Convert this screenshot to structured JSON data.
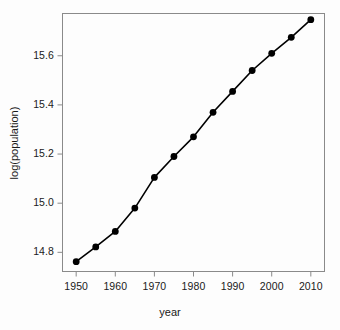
{
  "chart_data": {
    "type": "line",
    "title": "",
    "xlabel": "year",
    "ylabel": "log(population)",
    "x": [
      1950,
      1955,
      1960,
      1965,
      1970,
      1975,
      1980,
      1985,
      1990,
      1995,
      2000,
      2005,
      2010
    ],
    "values": [
      14.762,
      14.822,
      14.885,
      14.98,
      15.105,
      15.19,
      15.27,
      15.37,
      15.455,
      15.54,
      15.61,
      15.675,
      15.747
    ],
    "series": [
      {
        "name": "log(population)",
        "values": [
          14.762,
          14.822,
          14.885,
          14.98,
          15.105,
          15.19,
          15.27,
          15.37,
          15.455,
          15.54,
          15.61,
          15.675,
          15.747
        ]
      }
    ],
    "xlim": [
      1946.5,
      2013.5
    ],
    "ylim": [
      14.722,
      15.772
    ],
    "xticks": [
      1950,
      1960,
      1970,
      1980,
      1990,
      2000,
      2010
    ],
    "xticklabels": [
      "1950",
      "1960",
      "1970",
      "1980",
      "1990",
      "2000",
      "2010"
    ],
    "yticks": [
      14.8,
      15.0,
      15.2,
      15.4,
      15.6
    ],
    "yticklabels": [
      "14.8",
      "15.0",
      "15.2",
      "15.4",
      "15.6"
    ],
    "grid": false,
    "legend": null,
    "marker": "filled-circle",
    "marker_color": "#000000",
    "line_color": "#000000",
    "frame_color": "#888888",
    "background": "#fdfdfd"
  }
}
